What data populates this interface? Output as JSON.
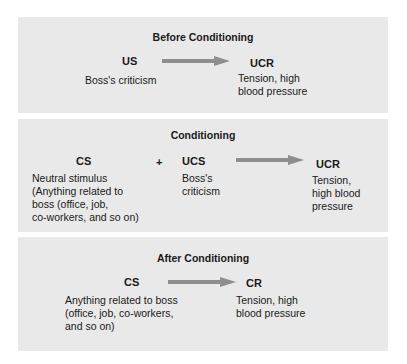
{
  "diagram": {
    "type": "classical-conditioning-flow",
    "arrow_color": "#8e8e8e",
    "panel_color": "#e9e9e9",
    "panels": [
      {
        "title": "Before Conditioning",
        "stimulus": {
          "label": "US",
          "description": "Boss's criticism"
        },
        "response": {
          "label": "UCR",
          "description_lines": [
            "Tension, high",
            "blood pressure"
          ]
        }
      },
      {
        "title": "Conditioning",
        "stimulus": {
          "label": "CS",
          "description_lines": [
            "Neutral stimulus",
            "(Anything related to",
            "boss (office, job,",
            "co-workers,  and so on)"
          ]
        },
        "plus": "+",
        "second_stimulus": {
          "label": "UCS",
          "description_lines": [
            "Boss's",
            "criticism"
          ]
        },
        "response": {
          "label": "UCR",
          "description_lines": [
            "Tension,",
            "high blood",
            "pressure"
          ]
        }
      },
      {
        "title": "After Conditioning",
        "stimulus": {
          "label": "CS",
          "description_lines": [
            "Anything related to boss",
            "(office, job, co-workers,",
            "and so on)"
          ]
        },
        "response": {
          "label": "CR",
          "description_lines": [
            "Tension, high",
            "blood pressure"
          ]
        }
      }
    ]
  }
}
